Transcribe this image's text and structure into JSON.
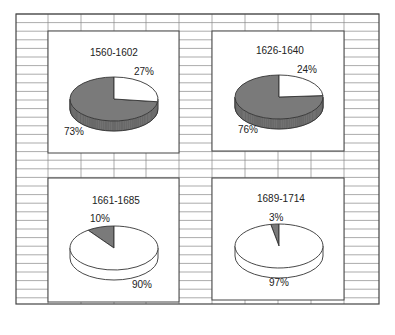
{
  "chart_data": [
    {
      "type": "pie",
      "title": "1560-1602",
      "categories": [
        "dark segment",
        "light segment"
      ],
      "values": [
        73,
        27
      ],
      "labels": [
        "73%",
        "27%"
      ],
      "style": "3d"
    },
    {
      "type": "pie",
      "title": "1626-1640",
      "categories": [
        "dark segment",
        "light segment"
      ],
      "values": [
        76,
        24
      ],
      "labels": [
        "76%",
        "24%"
      ],
      "style": "3d"
    },
    {
      "type": "pie",
      "title": "1661-1685",
      "categories": [
        "dark segment",
        "light segment"
      ],
      "values": [
        10,
        90
      ],
      "labels": [
        "10%",
        "90%"
      ],
      "style": "3d"
    },
    {
      "type": "pie",
      "title": "1689-1714",
      "categories": [
        "dark segment",
        "light segment"
      ],
      "values": [
        3,
        97
      ],
      "labels": [
        "3%",
        "97%"
      ],
      "style": "3d"
    }
  ],
  "panels": [
    {
      "title": "1560-1602",
      "dark_label": "73%",
      "light_label": "27%"
    },
    {
      "title": "1626-1640",
      "dark_label": "76%",
      "light_label": "24%"
    },
    {
      "title": "1661-1685",
      "dark_label": "10%",
      "light_label": "90%"
    },
    {
      "title": "1689-1714",
      "dark_label": "3%",
      "light_label": "97%"
    }
  ],
  "colors": {
    "dark": "#7a7a7a",
    "dark_side": "#6a6a6a",
    "light": "#ffffff",
    "line": "#333333",
    "grid": "#888888"
  }
}
